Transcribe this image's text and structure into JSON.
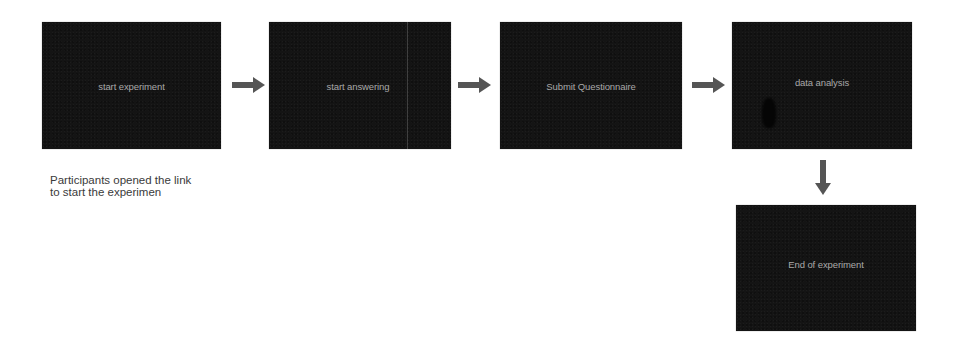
{
  "diagram": {
    "type": "flowchart",
    "colors": {
      "box_fill": "#141414",
      "box_text": "#a9a9a9",
      "arrow": "#555555",
      "caption_text": "#3a3a3a",
      "background": "#ffffff"
    },
    "steps": [
      {
        "id": "step-1",
        "label": "start experiment"
      },
      {
        "id": "step-2",
        "label": "start answering"
      },
      {
        "id": "step-3",
        "label": "Submit Questionnaire"
      },
      {
        "id": "step-4",
        "label": "data analysis"
      },
      {
        "id": "step-5",
        "label": "End of experiment"
      }
    ],
    "connections": [
      {
        "from": "step-1",
        "to": "step-2",
        "direction": "right"
      },
      {
        "from": "step-2",
        "to": "step-3",
        "direction": "right"
      },
      {
        "from": "step-3",
        "to": "step-4",
        "direction": "right"
      },
      {
        "from": "step-4",
        "to": "step-5",
        "direction": "down"
      }
    ],
    "caption": {
      "line1": "Participants opened the link",
      "line2": "to start the experimen"
    }
  }
}
